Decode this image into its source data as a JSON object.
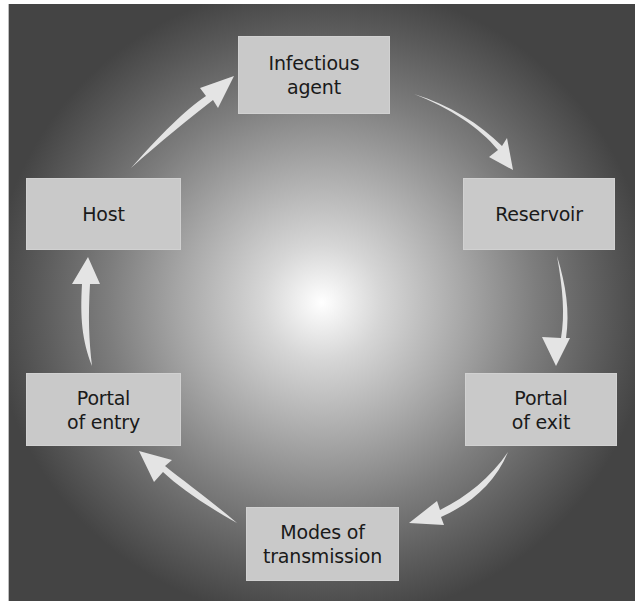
{
  "diagram": {
    "type": "cycle",
    "title": "",
    "colors": {
      "frame_outer": "#444444",
      "frame_center": "#ffffff",
      "node_fill": "#c9c9c9",
      "node_text": "#1a1a1a",
      "arrow_fill": "#e4e4e4"
    },
    "nodes": [
      {
        "id": "infectious-agent",
        "label": "Infectious\nagent"
      },
      {
        "id": "reservoir",
        "label": "Reservoir"
      },
      {
        "id": "portal-of-exit",
        "label": "Portal\nof exit"
      },
      {
        "id": "modes-of-transmission",
        "label": "Modes of\ntransmission"
      },
      {
        "id": "portal-of-entry",
        "label": "Portal\nof entry"
      },
      {
        "id": "host",
        "label": "Host"
      }
    ],
    "edges": [
      {
        "from": "infectious-agent",
        "to": "reservoir"
      },
      {
        "from": "reservoir",
        "to": "portal-of-exit"
      },
      {
        "from": "portal-of-exit",
        "to": "modes-of-transmission"
      },
      {
        "from": "modes-of-transmission",
        "to": "portal-of-entry"
      },
      {
        "from": "portal-of-entry",
        "to": "host"
      },
      {
        "from": "host",
        "to": "infectious-agent"
      }
    ]
  }
}
